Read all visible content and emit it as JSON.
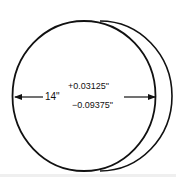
{
  "diagram": {
    "type": "circular-disk-dimension",
    "nominal_diameter": "14\"",
    "tolerance_plus": "+0.03125\"",
    "tolerance_minus": "−0.09375\"",
    "colors": {
      "stroke": "#111111",
      "background": "#ffffff"
    }
  }
}
